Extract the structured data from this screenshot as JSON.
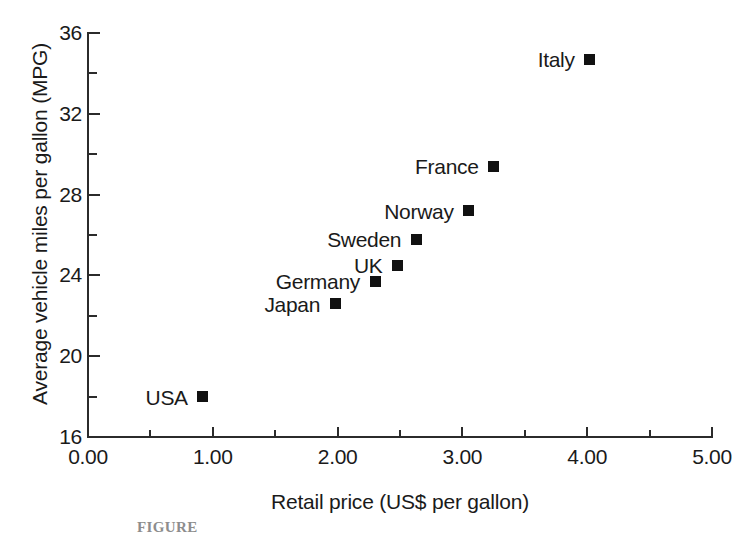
{
  "chart_data": {
    "type": "scatter",
    "title": "",
    "xlabel": "Retail price (US$ per gallon)",
    "ylabel": "Average vehicle miles per gallon (MPG)",
    "xlim": [
      0.0,
      5.0
    ],
    "ylim": [
      16,
      36
    ],
    "x_ticks": [
      "0.00",
      "1.00",
      "2.00",
      "3.00",
      "4.00",
      "5.00"
    ],
    "x_tick_values": [
      0.0,
      1.0,
      2.0,
      3.0,
      4.0,
      5.0
    ],
    "x_minor_tick_values": [
      0.5,
      1.5,
      2.5,
      3.5,
      4.5
    ],
    "y_ticks": [
      "16",
      "20",
      "24",
      "28",
      "32",
      "36"
    ],
    "y_tick_values": [
      16,
      20,
      24,
      28,
      32,
      36
    ],
    "y_minor_tick_values": [
      18,
      22,
      26,
      30,
      34
    ],
    "grid": false,
    "legend": "none",
    "marker": "filled-square",
    "marker_color": "#111111",
    "label_position": "left-of-marker",
    "points": [
      {
        "label": "USA",
        "x": 0.92,
        "y": 18.0
      },
      {
        "label": "Japan",
        "x": 1.98,
        "y": 22.6
      },
      {
        "label": "Germany",
        "x": 2.3,
        "y": 23.7
      },
      {
        "label": "UK",
        "x": 2.48,
        "y": 24.5
      },
      {
        "label": "Sweden",
        "x": 2.63,
        "y": 25.8
      },
      {
        "label": "Norway",
        "x": 3.05,
        "y": 27.2
      },
      {
        "label": "France",
        "x": 3.25,
        "y": 29.4
      },
      {
        "label": "Italy",
        "x": 4.02,
        "y": 34.7
      }
    ]
  },
  "caption": "FIGURE"
}
